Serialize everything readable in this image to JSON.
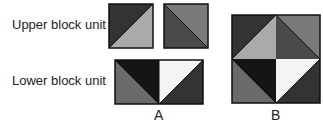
{
  "labels": {
    "upper": "Upper block unit",
    "lower": "Lower block unit",
    "a": "A",
    "b": "B"
  },
  "colors": {
    "black": "#151515",
    "dark": "#333333",
    "darkgray": "#4a4a4a",
    "medgray": "#6a6a6a",
    "gray": "#7a7a7a",
    "light": "#aaaaaa",
    "white": "#f4f4f4",
    "stroke": "#111111"
  }
}
